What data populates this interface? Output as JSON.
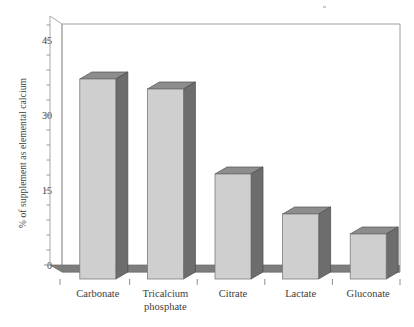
{
  "chart_data": {
    "type": "bar",
    "title": "",
    "subtitle": "",
    "xlabel": "",
    "ylabel": "% of supplement as elemental calcium",
    "categories": [
      "Carbonate",
      "Tricalcium\nphosphate",
      "Citrate",
      "Lactate",
      "Gluconate"
    ],
    "values": [
      40,
      38,
      21,
      13,
      9
    ],
    "ylim": [
      0,
      48
    ],
    "yticks": [
      0,
      15,
      30,
      45
    ],
    "ytick_labels": [
      "0",
      "15",
      "30",
      "45"
    ],
    "minor_tick_interval": 3,
    "grid": false,
    "legend": null,
    "style": "3d-bar",
    "colors": {
      "bar_front": "#cfcfcf",
      "bar_side": "#6d6d6d",
      "bar_top": "#8d8d8d",
      "floor": "#7d7d7d",
      "frame": "#9a9a9a",
      "text": "#3d3d3d"
    },
    "annotations": []
  },
  "axes": {
    "y_title": "% of supplement as elemental calcium",
    "y_labels": [
      "45",
      "30",
      "15",
      "0"
    ]
  }
}
